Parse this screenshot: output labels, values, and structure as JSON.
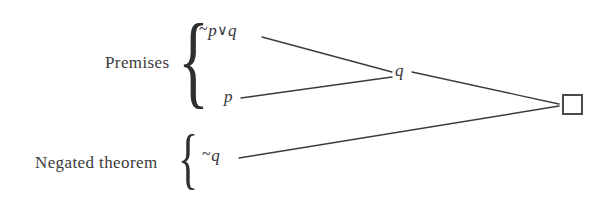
{
  "diagram": {
    "type": "resolution-refutation-tree",
    "background_color": "#ffffff",
    "line_color": "#3a3a42",
    "text_color": "#33333a",
    "groups": [
      {
        "id": "premises",
        "label": "Premises",
        "brace": "{",
        "members": [
          "~p∨q",
          "p"
        ]
      },
      {
        "id": "negated-theorem",
        "label": "Negated theorem",
        "brace": "{",
        "members": [
          "~q"
        ]
      }
    ],
    "nodes": [
      {
        "id": "not-p-or-q",
        "neg": "~",
        "var1": "p",
        "op": "∨",
        "var2": "q",
        "full": "~p∨q",
        "x": 199,
        "y": 21
      },
      {
        "id": "p",
        "text": "p",
        "x": 224,
        "y": 87
      },
      {
        "id": "q",
        "text": "q",
        "x": 395,
        "y": 61
      },
      {
        "id": "not-q",
        "neg": "~",
        "text": "q",
        "full": "~q",
        "x": 202,
        "y": 146
      },
      {
        "id": "empty-clause",
        "text": "□",
        "x": 562,
        "y": 94
      }
    ],
    "edges": [
      {
        "from": "not-p-or-q",
        "to": "q",
        "x1": 262,
        "y1": 37,
        "x2": 392,
        "y2": 72
      },
      {
        "from": "p",
        "to": "q",
        "x1": 241,
        "y1": 98,
        "x2": 392,
        "y2": 77
      },
      {
        "from": "q",
        "to": "empty-clause",
        "x1": 412,
        "y1": 72,
        "x2": 559,
        "y2": 104
      },
      {
        "from": "not-q",
        "to": "empty-clause",
        "x1": 239,
        "y1": 158,
        "x2": 559,
        "y2": 106
      }
    ],
    "empty_clause_symbol": "□"
  }
}
